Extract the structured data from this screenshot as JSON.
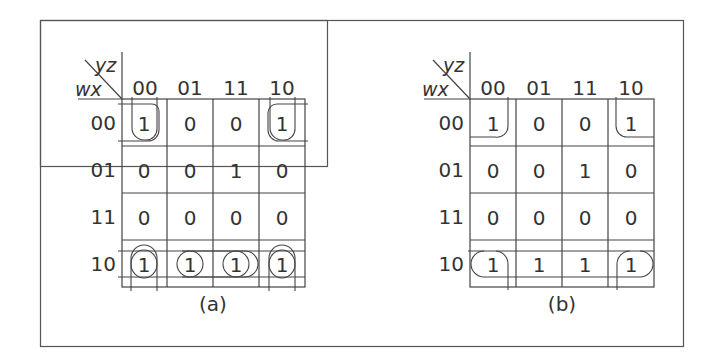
{
  "figure": {
    "maps": [
      {
        "id": "a",
        "caption": "(a)",
        "corner_row_var": "wx",
        "corner_col_var": "yz",
        "col_labels": [
          "00",
          "01",
          "11",
          "10"
        ],
        "row_labels": [
          "00",
          "01",
          "11",
          "10"
        ],
        "cells": [
          [
            "1",
            "0",
            "0",
            "1"
          ],
          [
            "0",
            "0",
            "1",
            "0"
          ],
          [
            "0",
            "0",
            "0",
            "0"
          ],
          [
            "1",
            "1",
            "1",
            "1"
          ]
        ],
        "groupings": "corner wrap-around loops and bottom row loops"
      },
      {
        "id": "b",
        "caption": "(b)",
        "corner_row_var": "wx",
        "corner_col_var": "yz",
        "col_labels": [
          "00",
          "01",
          "11",
          "10"
        ],
        "row_labels": [
          "00",
          "01",
          "11",
          "10"
        ],
        "cells": [
          [
            "1",
            "0",
            "0",
            "1"
          ],
          [
            "0",
            "0",
            "1",
            "0"
          ],
          [
            "0",
            "0",
            "0",
            "0"
          ],
          [
            "1",
            "1",
            "1",
            "1"
          ]
        ],
        "groupings": "corner group and bottom row group"
      }
    ]
  }
}
